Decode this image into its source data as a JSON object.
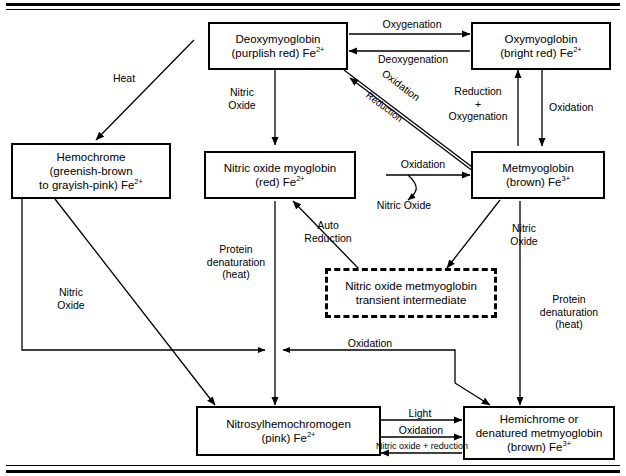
{
  "diagram": {
    "nodes": [
      {
        "id": "deoxymyoglobin",
        "line1": "Deoxymyoglobin",
        "line2": "(purplish red) Fe",
        "charge": "2+"
      },
      {
        "id": "oxymyoglobin",
        "line1": "Oxymyoglobin",
        "line2": "(bright red) Fe",
        "charge": "2+"
      },
      {
        "id": "hemochrome",
        "line1": "Hemochrome",
        "line2": "(greenish-brown",
        "line3": "to grayish-pink) Fe",
        "charge": "2+"
      },
      {
        "id": "nitric-oxide-myoglobin",
        "line1": "Nitric oxide myoglobin",
        "line2": "(red) Fe",
        "charge": "2+"
      },
      {
        "id": "metmyoglobin",
        "line1": "Metmyoglobin",
        "line2": "(brown) Fe",
        "charge": "3+"
      },
      {
        "id": "nitric-oxide-metmyoglobin",
        "line1": "Nitric oxide metmyoglobin",
        "line2": "transient intermediate",
        "charge": ""
      },
      {
        "id": "nitrosylhemochromogen",
        "line1": "Nitrosylhemochromogen",
        "line2": "(pink) Fe",
        "charge": "2+"
      },
      {
        "id": "hemichrome",
        "line1": "Hemichrome or",
        "line2": "denatured metmyoglobin",
        "line3": "(brown) Fe",
        "charge": "3+"
      }
    ],
    "edge_labels": {
      "oxygenation": "Oxygenation",
      "deoxygenation": "Deoxygenation",
      "oxidation_diag": "Oxidation",
      "reduction_diag": "Reduction",
      "heat": "Heat",
      "nitric_oxide_top": "Nitric\nOxide",
      "reduction_oxygenation": "Reduction\n+\nOxygenation",
      "oxidation_right": "Oxidation",
      "oxidation_mid": "Oxidation",
      "nitric_oxide_released": "Nitric Oxide",
      "auto_reduction": "Auto\nReduction",
      "nitric_oxide_met": "Nitric\nOxide",
      "protein_denaturation_left": "Protein\ndenaturation\n(heat)",
      "protein_denaturation_right": "Protein\ndenaturation\n(heat)",
      "nitric_oxide_lower_left": "Nitric\nOxide",
      "oxidation_lower": "Oxidation",
      "light": "Light",
      "oxidation_bottom": "Oxidation",
      "nitric_oxide_reduction": "Nitric oxide + reduction"
    },
    "colors": {
      "stroke": "#000000",
      "background": "#ffffff"
    }
  }
}
